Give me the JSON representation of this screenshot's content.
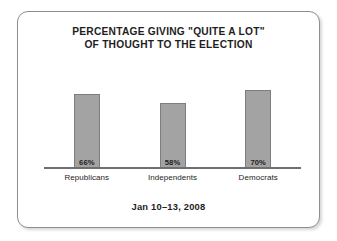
{
  "card": {
    "title_lines": [
      "PERCENTAGE GIVING \"QUITE A LOT\"",
      "OF THOUGHT TO THE ELECTION"
    ],
    "footer_note": "Jan 10–13, 2008"
  },
  "colors": {
    "bar_fill": "#a3a3a3",
    "bar_border": "#7d7d7d",
    "axis": "#6f6f6f",
    "card_border": "#8e8e8e",
    "text": "#1d1d1d",
    "background": "#ffffff"
  },
  "chart_data": {
    "type": "bar",
    "title": "PERCENTAGE GIVING \"QUITE A LOT\" OF THOUGHT TO THE ELECTION",
    "subtitle": "Jan 10–13, 2008",
    "categories": [
      "Republicans",
      "Independents",
      "Democrats"
    ],
    "values": [
      66,
      58,
      70
    ],
    "value_labels": [
      "66%",
      "58%",
      "70%"
    ],
    "xlabel": "",
    "ylabel": "",
    "ylim": [
      0,
      90
    ],
    "grid": false,
    "legend": "none",
    "units": "percent"
  }
}
